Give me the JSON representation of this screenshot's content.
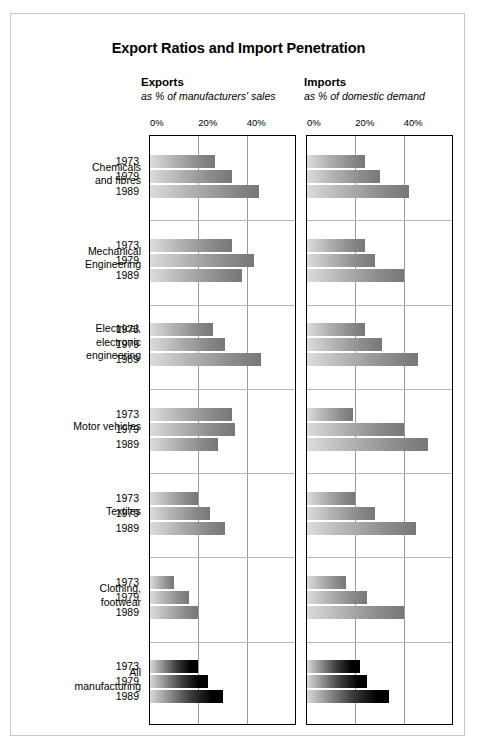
{
  "title": "Export Ratios and Import Penetration",
  "panels": {
    "left": {
      "title": "Exports",
      "subtitle": "as % of manufacturers' sales"
    },
    "right": {
      "title": "Imports",
      "subtitle": "as % of domestic demand"
    }
  },
  "axis": {
    "ticks": [
      "0%",
      "20%",
      "40%"
    ],
    "tick_values": [
      0,
      20,
      40
    ],
    "min": 0,
    "max": 60
  },
  "years": [
    "1973",
    "1979",
    "1989"
  ],
  "categories": [
    "Chemicals and fibres",
    "Mechanical Engineering",
    "Electrical, electronic engineering",
    "Motor vehicles",
    "Textiles",
    "Clothing, footwear",
    "All manufacturing"
  ],
  "category_lines": [
    [
      "Chemicals",
      "and fibres"
    ],
    [
      "Mechanical",
      "Engineering"
    ],
    [
      "Electrical,",
      "electronic",
      "engineering"
    ],
    [
      "Motor vehicles"
    ],
    [
      "Textiles"
    ],
    [
      "Clothing,",
      "footwear"
    ],
    [
      "All",
      "manufacturing"
    ]
  ],
  "chart_data": {
    "type": "bar",
    "title": "Export Ratios and Import Penetration",
    "orientation": "horizontal",
    "grid": true,
    "legend": "none",
    "xlabel": "",
    "ylabel": "",
    "xlim": [
      0,
      60
    ],
    "xticks": [
      0,
      20,
      40
    ],
    "categories": [
      "Chemicals and fibres",
      "Mechanical Engineering",
      "Electrical, electronic engineering",
      "Motor vehicles",
      "Textiles",
      "Clothing, footwear",
      "All manufacturing"
    ],
    "subcategories": [
      "1973",
      "1979",
      "1989"
    ],
    "panels": [
      {
        "name": "Exports",
        "unit": "% of manufacturers' sales",
        "series": [
          {
            "name": "1973",
            "values": [
              27,
              34,
              26,
              34,
              20,
              10,
              20
            ]
          },
          {
            "name": "1979",
            "values": [
              34,
              43,
              31,
              35,
              25,
              16,
              24
            ]
          },
          {
            "name": "1989",
            "values": [
              45,
              38,
              46,
              28,
              31,
              20,
              30
            ]
          }
        ]
      },
      {
        "name": "Imports",
        "unit": "% of domestic demand",
        "series": [
          {
            "name": "1973",
            "values": [
              24,
              24,
              24,
              19,
              20,
              16,
              22
            ]
          },
          {
            "name": "1979",
            "values": [
              30,
              28,
              31,
              40,
              28,
              25,
              25
            ]
          },
          {
            "name": "1989",
            "values": [
              42,
              40,
              46,
              50,
              45,
              40,
              34
            ]
          }
        ]
      }
    ]
  }
}
